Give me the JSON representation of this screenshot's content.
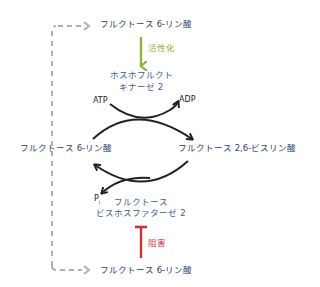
{
  "diagram": {
    "nodes": {
      "top_f6p": "フルクトース 6-リン酸",
      "left_f6p": "フルクトース 6-リン酸",
      "right_f26bp": "フルクトース 2,6-ビスリン酸",
      "bottom_f6p": "フルクトース 6-リン酸",
      "pfk2_line1": "ホスホフルクト",
      "pfk2_line2": "キナーゼ 2",
      "fbpase2_line1": "フルクトース",
      "fbpase2_line2": "ビスホスファターゼ 2",
      "atp": "ATP",
      "adp": "ADP",
      "pi": "P",
      "pi_sub": "i"
    },
    "edges": {
      "activation_label": "活性化",
      "inhibition_label": "阻害"
    },
    "colors": {
      "text_blue": "#3a5a96",
      "activation_green": "#8db33a",
      "inhibition_red": "#c8343a",
      "dashed_gray": "#b0b0b0",
      "curve_black": "#222222"
    }
  }
}
